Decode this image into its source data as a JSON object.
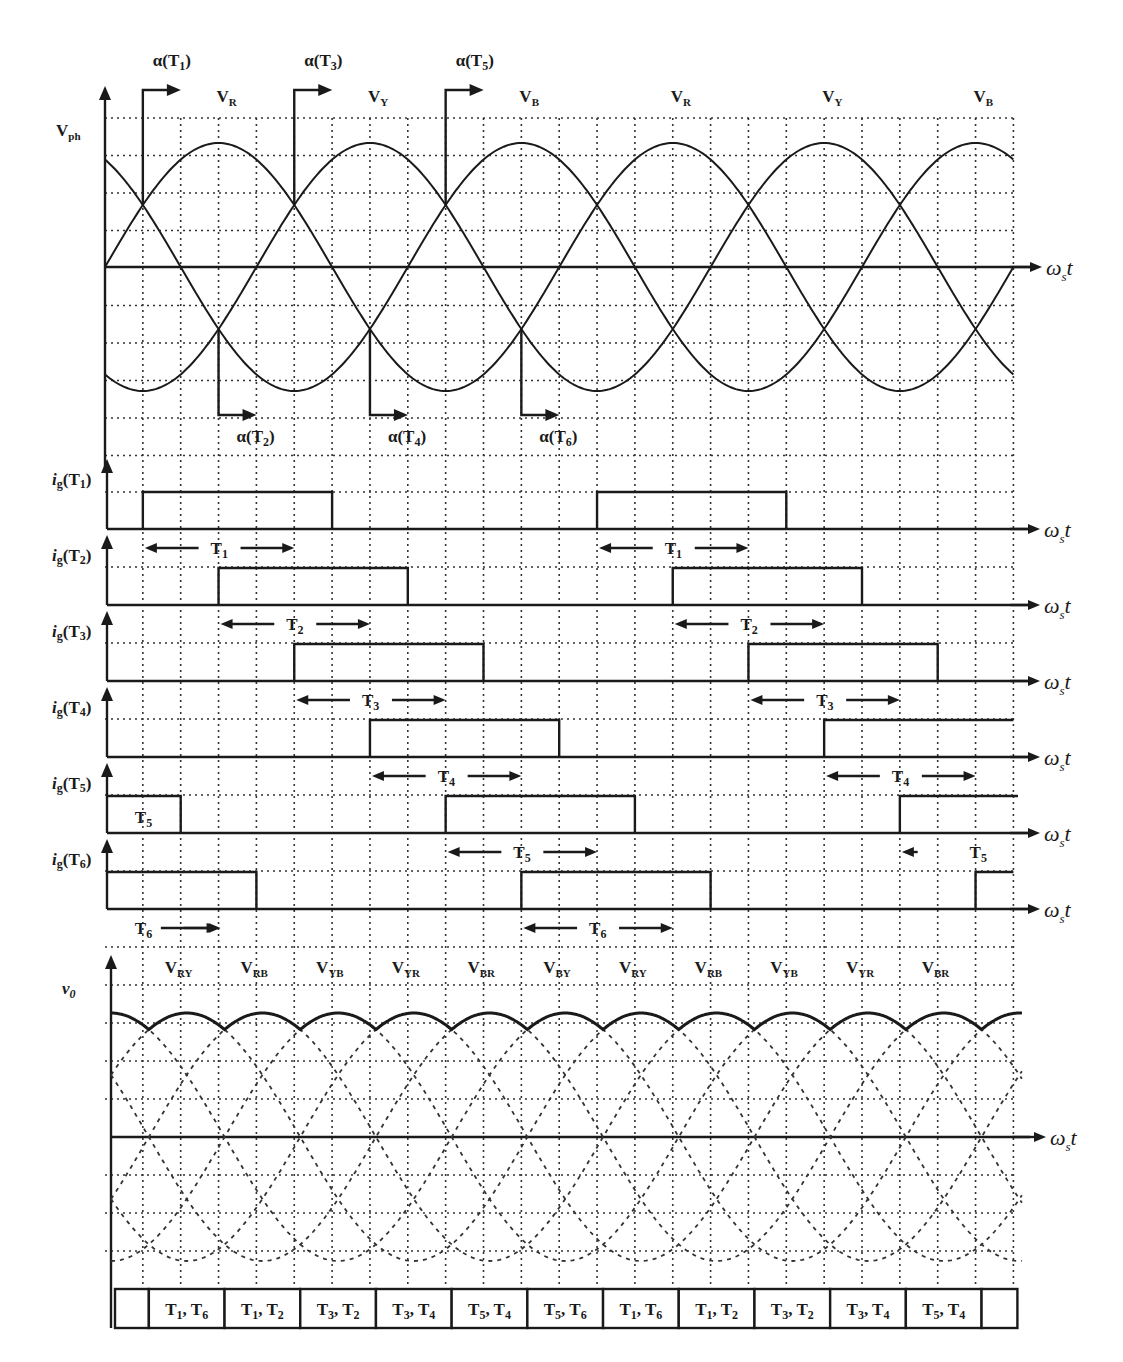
{
  "figure": {
    "colors": {
      "ink": "#1a1a1a",
      "background": "#ffffff"
    }
  },
  "chart_data": [
    {
      "type": "line",
      "title": "Phase voltages",
      "ylabel": "Vph",
      "xlabel": "ωst",
      "x_unit_deg_per_grid": 30,
      "x_range_deg": [
        0,
        720
      ],
      "series": [
        {
          "name": "VR",
          "phase_deg": 0,
          "amplitude": 1
        },
        {
          "name": "VY",
          "phase_deg": -120,
          "amplitude": 1
        },
        {
          "name": "VB",
          "phase_deg": 120,
          "amplitude": 1
        }
      ],
      "phase_labels": [
        {
          "text": "V",
          "sub": "R",
          "deg": 90
        },
        {
          "text": "V",
          "sub": "Y",
          "deg": 210
        },
        {
          "text": "V",
          "sub": "B",
          "deg": 330
        },
        {
          "text": "V",
          "sub": "R",
          "deg": 450
        },
        {
          "text": "V",
          "sub": "Y",
          "deg": 570
        },
        {
          "text": "V",
          "sub": "B",
          "deg": 690
        }
      ],
      "firing_markers_top": [
        {
          "label": "α(T",
          "sub": "1",
          "deg": 30
        },
        {
          "label": "α(T",
          "sub": "3",
          "deg": 150
        },
        {
          "label": "α(T",
          "sub": "5",
          "deg": 270
        }
      ],
      "firing_markers_bottom": [
        {
          "label": "α(T",
          "sub": "2",
          "deg": 90
        },
        {
          "label": "α(T",
          "sub": "4",
          "deg": 210
        },
        {
          "label": "α(T",
          "sub": "6",
          "deg": 330
        }
      ]
    },
    {
      "type": "line",
      "title": "Gate pulses",
      "xlabel": "ωst",
      "rows": [
        {
          "name": "ig(T1)",
          "thyristor": "1",
          "pulses_deg": [
            [
              30,
              180
            ],
            [
              390,
              540
            ]
          ],
          "conduction": [
            {
              "label": "T",
              "sub": "1",
              "from": 30,
              "to": 150
            },
            {
              "label": "T",
              "sub": "1",
              "from": 390,
              "to": 510
            }
          ]
        },
        {
          "name": "ig(T2)",
          "thyristor": "2",
          "pulses_deg": [
            [
              90,
              240
            ],
            [
              450,
              600
            ]
          ],
          "conduction": [
            {
              "label": "T",
              "sub": "2",
              "from": 90,
              "to": 210
            },
            {
              "label": "T",
              "sub": "2",
              "from": 450,
              "to": 570
            }
          ]
        },
        {
          "name": "ig(T3)",
          "thyristor": "3",
          "pulses_deg": [
            [
              150,
              300
            ],
            [
              510,
              660
            ]
          ],
          "conduction": [
            {
              "label": "T",
              "sub": "3",
              "from": 150,
              "to": 270
            },
            {
              "label": "T",
              "sub": "3",
              "from": 510,
              "to": 630
            }
          ]
        },
        {
          "name": "ig(T4)",
          "thyristor": "4",
          "pulses_deg": [
            [
              210,
              360
            ],
            [
              570,
              720
            ]
          ],
          "conduction": [
            {
              "label": "T",
              "sub": "4",
              "from": 210,
              "to": 330
            },
            {
              "label": "T",
              "sub": "4",
              "from": 570,
              "to": 690
            }
          ]
        },
        {
          "name": "ig(T5)",
          "thyristor": "5",
          "pulses_deg": [
            [
              0,
              60
            ],
            [
              270,
              420
            ],
            [
              630,
              725
            ]
          ],
          "conduction": [
            {
              "label": "T",
              "sub": "5",
              "from": 0,
              "to": 60,
              "noarrow": true
            },
            {
              "label": "T",
              "sub": "5",
              "from": 270,
              "to": 390
            },
            {
              "label": "T",
              "sub": "5",
              "from": 630,
              "to": 690,
              "leftonly": true
            }
          ]
        },
        {
          "name": "ig(T6)",
          "thyristor": "6",
          "pulses_deg": [
            [
              0,
              120
            ],
            [
              330,
              480
            ],
            [
              690,
              720
            ]
          ],
          "conduction": [
            {
              "label": "T",
              "sub": "6",
              "from": 0,
              "to": 90,
              "rightonly": true
            },
            {
              "label": "T",
              "sub": "6",
              "from": 330,
              "to": 450
            }
          ]
        }
      ]
    },
    {
      "type": "line",
      "title": "Output voltage",
      "ylabel": "v0",
      "xlabel": "ωst",
      "line_voltage_labels": [
        {
          "text": "V",
          "sub": "RY",
          "deg": 60
        },
        {
          "text": "V",
          "sub": "RB",
          "deg": 120
        },
        {
          "text": "V",
          "sub": "YB",
          "deg": 180
        },
        {
          "text": "V",
          "sub": "YR",
          "deg": 240
        },
        {
          "text": "V",
          "sub": "BR",
          "deg": 300
        },
        {
          "text": "V",
          "sub": "BY",
          "deg": 360
        },
        {
          "text": "V",
          "sub": "RY",
          "deg": 420
        },
        {
          "text": "V",
          "sub": "RB",
          "deg": 480
        },
        {
          "text": "V",
          "sub": "YB",
          "deg": 540
        },
        {
          "text": "V",
          "sub": "YR",
          "deg": 600
        },
        {
          "text": "V",
          "sub": "BR",
          "deg": 660
        }
      ],
      "series": [
        {
          "name": "VRY",
          "peak_deg": 60
        },
        {
          "name": "VRB",
          "peak_deg": 120
        },
        {
          "name": "VYB",
          "peak_deg": 180
        },
        {
          "name": "VYR",
          "peak_deg": 240
        },
        {
          "name": "VBR",
          "peak_deg": 300
        },
        {
          "name": "VBY",
          "peak_deg": 0
        }
      ],
      "envelope": "max of line voltages (solid)"
    },
    {
      "type": "table",
      "title": "Conducting thyristor pairs",
      "cells": [
        {
          "text": ""
        },
        {
          "text": "T1, T6",
          "a": "1",
          "b": "6"
        },
        {
          "text": "T1, T2",
          "a": "1",
          "b": "2"
        },
        {
          "text": "T3, T2",
          "a": "3",
          "b": "2"
        },
        {
          "text": "T3, T4",
          "a": "3",
          "b": "4"
        },
        {
          "text": "T5, T4",
          "a": "5",
          "b": "4"
        },
        {
          "text": "T5, T6",
          "a": "5",
          "b": "6"
        },
        {
          "text": "T1, T6",
          "a": "1",
          "b": "6"
        },
        {
          "text": "T1, T2",
          "a": "1",
          "b": "2"
        },
        {
          "text": "T3, T2",
          "a": "3",
          "b": "2"
        },
        {
          "text": "T3, T4",
          "a": "3",
          "b": "4"
        },
        {
          "text": "T5, T4",
          "a": "5",
          "b": "4"
        },
        {
          "text": ""
        }
      ]
    }
  ],
  "labels": {
    "vph": "V",
    "vph_sub": "ph",
    "v0": "v",
    "v0_sub": "0",
    "omega_t": "ω",
    "omega_sub": "s",
    "omega_t_suffix": "t",
    "ig_prefix": "i",
    "ig_sub": "g"
  }
}
